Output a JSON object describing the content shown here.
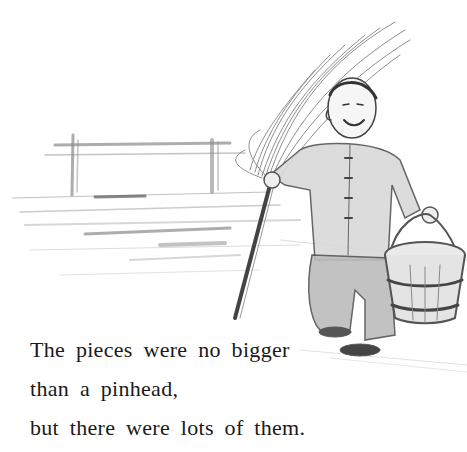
{
  "page": {
    "illustration": {
      "description": "Pencil sketch of a smiling boy in a padded jacket carrying a long-handled broom over his shoulder and a wooden bucket in his other hand, walking past a wooden frame/rail structure on the ground",
      "elements": [
        "broom",
        "boy",
        "bucket",
        "wooden-frame",
        "ground-strokes"
      ]
    },
    "text": {
      "lines": [
        "The pieces were no bigger",
        "than a pinhead,",
        "but there were lots of them."
      ]
    }
  }
}
